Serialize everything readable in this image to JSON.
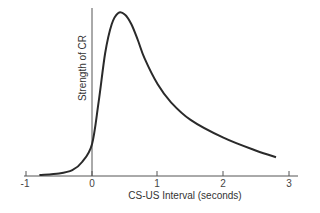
{
  "chart_data": {
    "type": "line",
    "title": "",
    "xlabel": "CS-US Interval (seconds)",
    "ylabel": "Strength of CR",
    "xlim": [
      -1,
      3
    ],
    "ylim": [
      0,
      1
    ],
    "x_ticks": [
      "-1",
      "0",
      "1",
      "2",
      "3"
    ],
    "grid": false,
    "legend": null,
    "series": [
      {
        "name": "Strength of CR",
        "x": [
          -0.8,
          -0.5,
          -0.3,
          -0.15,
          0,
          0.1,
          0.2,
          0.3,
          0.4,
          0.5,
          0.6,
          0.7,
          0.8,
          1.0,
          1.2,
          1.5,
          2.0,
          2.5,
          2.8
        ],
        "y": [
          0.0,
          0.01,
          0.03,
          0.08,
          0.19,
          0.45,
          0.75,
          0.93,
          1.0,
          0.99,
          0.93,
          0.83,
          0.72,
          0.56,
          0.45,
          0.34,
          0.23,
          0.15,
          0.11
        ]
      }
    ]
  }
}
